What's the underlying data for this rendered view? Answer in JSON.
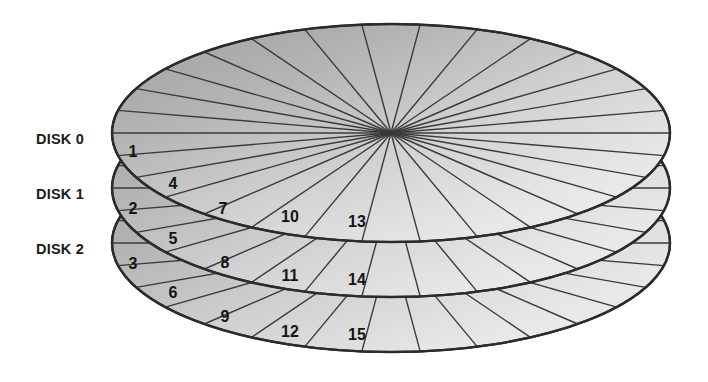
{
  "figure": {
    "background_color": "#ffffff",
    "outline_color": "#2b2b2b",
    "sector_line_color": "#3a3a3a",
    "shade_dark": "#a6a6a6",
    "shade_light": "#ececec"
  },
  "labels": [
    {
      "text": "DISK 0",
      "x": 36,
      "y": 139
    },
    {
      "text": "DISK 1",
      "x": 36,
      "y": 194
    },
    {
      "text": "DISK 2",
      "x": 36,
      "y": 249
    }
  ],
  "disks": [
    {
      "name": "DISK 0",
      "cx": 391,
      "cy": 133,
      "rx": 279,
      "ry": 109,
      "sectors": 30
    },
    {
      "name": "DISK 1",
      "cx": 391,
      "cy": 188,
      "rx": 279,
      "ry": 109,
      "sectors": 30
    },
    {
      "name": "DISK 2",
      "cx": 391,
      "cy": 243,
      "rx": 279,
      "ry": 109,
      "sectors": 30
    }
  ],
  "stripe_numbers": [
    {
      "value": "1",
      "x": 133,
      "y": 153,
      "disk": "DISK 0"
    },
    {
      "value": "4",
      "x": 173,
      "y": 185,
      "disk": "DISK 0"
    },
    {
      "value": "7",
      "x": 223,
      "y": 210,
      "disk": "DISK 0"
    },
    {
      "value": "10",
      "x": 290,
      "y": 218,
      "disk": "DISK 0"
    },
    {
      "value": "13",
      "x": 357,
      "y": 223,
      "disk": "DISK 0"
    },
    {
      "value": "2",
      "x": 133,
      "y": 210,
      "disk": "DISK 1"
    },
    {
      "value": "5",
      "x": 173,
      "y": 240,
      "disk": "DISK 1"
    },
    {
      "value": "8",
      "x": 225,
      "y": 264,
      "disk": "DISK 1"
    },
    {
      "value": "11",
      "x": 290,
      "y": 277,
      "disk": "DISK 1"
    },
    {
      "value": "14",
      "x": 357,
      "y": 281,
      "disk": "DISK 1"
    },
    {
      "value": "3",
      "x": 133,
      "y": 265,
      "disk": "DISK 2"
    },
    {
      "value": "6",
      "x": 173,
      "y": 294,
      "disk": "DISK 2"
    },
    {
      "value": "9",
      "x": 225,
      "y": 318,
      "disk": "DISK 2"
    },
    {
      "value": "12",
      "x": 290,
      "y": 333,
      "disk": "DISK 2"
    },
    {
      "value": "15",
      "x": 357,
      "y": 336,
      "disk": "DISK 2"
    }
  ]
}
